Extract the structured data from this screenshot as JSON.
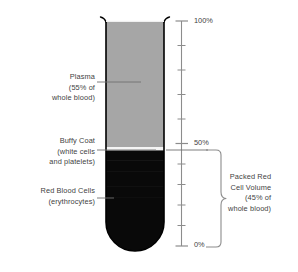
{
  "diagram": {
    "tube": {
      "layers": [
        {
          "id": "plasma",
          "name": "Plasma",
          "color": "#a6a6a6",
          "percent": 55
        },
        {
          "id": "buffy-coat",
          "name": "Buffy Coat",
          "color": "#f2f2f2",
          "percent": 1
        },
        {
          "id": "rbc",
          "name": "Red Blood Cells",
          "color": "#090909",
          "percent": 45
        }
      ],
      "outline_color": "#000000"
    },
    "labels": {
      "plasma": {
        "lines": [
          "Plasma",
          "(55% of",
          "whole blood)"
        ]
      },
      "buffy_coat": {
        "lines": [
          "Buffy Coat",
          "(white cells",
          "and platelets)"
        ]
      },
      "red_blood_cells": {
        "lines": [
          "Red Blood Cells",
          "(erythrocytes)"
        ]
      },
      "packed_red_cell_volume": {
        "lines": [
          "Packed Red",
          "Cell Volume",
          "(45% of",
          "whole blood)"
        ]
      }
    },
    "scale": {
      "axis_color": "#8c8c8c",
      "major_ticks": [
        {
          "value": "100%",
          "percent": 100
        },
        {
          "value": "50%",
          "percent": 50
        },
        {
          "value": "0%",
          "percent": 0
        }
      ],
      "minor_tick_percents": [
        90,
        80,
        70,
        60,
        40,
        30,
        20,
        10
      ]
    },
    "bracket": {
      "name": "packed-red-cell-volume-bracket",
      "from_percent": 50,
      "to_percent": 0,
      "color": "#8c8c8c"
    }
  }
}
